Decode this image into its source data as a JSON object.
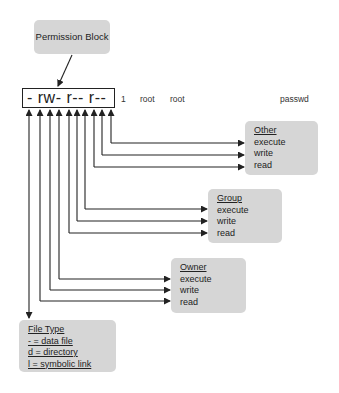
{
  "title_box": {
    "label": "Permission Block"
  },
  "permission_string": "- rw- r-- r--",
  "listing": {
    "links": "1",
    "owner": "root",
    "group": "root",
    "filename": "passwd"
  },
  "other": {
    "title": "Other",
    "items": [
      "execute",
      "write",
      "read"
    ]
  },
  "group": {
    "title": "Group",
    "items": [
      "execute",
      "write",
      "read"
    ]
  },
  "owner": {
    "title": "Owner",
    "items": [
      "execute",
      "write",
      "read"
    ]
  },
  "file_type": {
    "title": "File Type",
    "items": [
      "- = data file",
      "d = directory",
      "l = symbolic link"
    ]
  },
  "colors": {
    "box_fill": "#d6d6d6",
    "line": "#222222"
  }
}
